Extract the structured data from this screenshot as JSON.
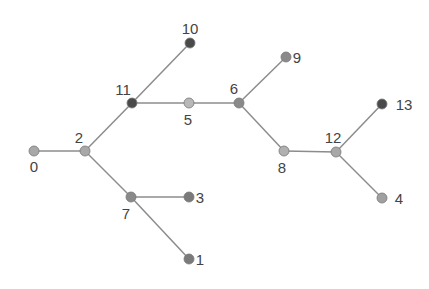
{
  "diagram": {
    "type": "tree",
    "edge_color": "#8c8c8c",
    "nodes": [
      {
        "id": "0",
        "x": 34,
        "y": 151,
        "color": "#a8a8a8",
        "lx": 34,
        "ly": 172,
        "anchor": "middle"
      },
      {
        "id": "1",
        "x": 189,
        "y": 259,
        "color": "#7a7a7a",
        "lx": 200,
        "ly": 265,
        "anchor": "middle"
      },
      {
        "id": "2",
        "x": 85,
        "y": 151,
        "color": "#a8a8a8",
        "lx": 79,
        "ly": 143,
        "anchor": "middle"
      },
      {
        "id": "3",
        "x": 189,
        "y": 197,
        "color": "#7a7a7a",
        "lx": 200,
        "ly": 203,
        "anchor": "middle"
      },
      {
        "id": "4",
        "x": 382,
        "y": 198,
        "color": "#a0a0a0",
        "lx": 399,
        "ly": 204,
        "anchor": "middle"
      },
      {
        "id": "5",
        "x": 189,
        "y": 103,
        "color": "#b8b8b8",
        "lx": 188,
        "ly": 125,
        "anchor": "middle"
      },
      {
        "id": "6",
        "x": 239,
        "y": 103,
        "color": "#8a8a8a",
        "lx": 234,
        "ly": 94,
        "anchor": "middle"
      },
      {
        "id": "7",
        "x": 131,
        "y": 197,
        "color": "#8a8a8a",
        "lx": 126,
        "ly": 219,
        "anchor": "middle"
      },
      {
        "id": "8",
        "x": 284,
        "y": 151,
        "color": "#b0b0b0",
        "lx": 282,
        "ly": 173,
        "anchor": "middle"
      },
      {
        "id": "9",
        "x": 286,
        "y": 57,
        "color": "#8a8a8a",
        "lx": 297,
        "ly": 63,
        "anchor": "middle"
      },
      {
        "id": "10",
        "x": 190,
        "y": 43,
        "color": "#4a4a4a",
        "lx": 190,
        "ly": 34,
        "anchor": "middle"
      },
      {
        "id": "11",
        "x": 132,
        "y": 103,
        "color": "#4a4a4a",
        "lx": 123,
        "ly": 95,
        "anchor": "middle"
      },
      {
        "id": "12",
        "x": 336,
        "y": 152,
        "color": "#a8a8a8",
        "lx": 333,
        "ly": 143,
        "anchor": "middle"
      },
      {
        "id": "13",
        "x": 382,
        "y": 104,
        "color": "#4a4a4a",
        "lx": 404,
        "ly": 110,
        "anchor": "middle"
      }
    ],
    "edges": [
      [
        "0",
        "2"
      ],
      [
        "2",
        "11"
      ],
      [
        "2",
        "7"
      ],
      [
        "11",
        "10"
      ],
      [
        "11",
        "5"
      ],
      [
        "5",
        "6"
      ],
      [
        "6",
        "9"
      ],
      [
        "6",
        "8"
      ],
      [
        "8",
        "12"
      ],
      [
        "12",
        "13"
      ],
      [
        "12",
        "4"
      ],
      [
        "7",
        "3"
      ],
      [
        "7",
        "1"
      ]
    ]
  }
}
